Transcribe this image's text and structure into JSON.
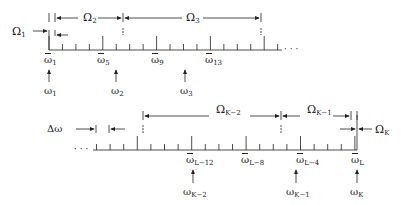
{
  "top_diagram": {
    "intervals": [
      {
        "symbol": "Ω",
        "subscript": "1",
        "x": 12,
        "y": 26
      },
      {
        "symbol": "Ω",
        "subscript": "2",
        "x": 83,
        "y": 12
      },
      {
        "symbol": "Ω",
        "subscript": "3",
        "x": 186,
        "y": 12
      }
    ],
    "grid_labels": [
      {
        "symbol": "ω̄",
        "subscript": "1",
        "x": 44,
        "y": 55
      },
      {
        "symbol": "ω̄",
        "subscript": "5",
        "x": 97,
        "y": 55
      },
      {
        "symbol": "ω̄",
        "subscript": "9",
        "x": 151,
        "y": 55
      },
      {
        "symbol": "ω̄",
        "subscript": "13",
        "x": 205,
        "y": 55
      }
    ],
    "center_labels": [
      {
        "symbol": "ω",
        "subscript": "1",
        "x": 44,
        "y": 86
      },
      {
        "symbol": "ω",
        "subscript": "2",
        "x": 111,
        "y": 86
      },
      {
        "symbol": "ω",
        "subscript": "3",
        "x": 180,
        "y": 86
      }
    ],
    "ellipsis": "· · ·"
  },
  "bottom_diagram": {
    "step_label": {
      "symbol": "Δω",
      "x": 47,
      "y": 124
    },
    "intervals": [
      {
        "symbol": "Ω",
        "subscript": "K−2",
        "x": 216,
        "y": 104
      },
      {
        "symbol": "Ω",
        "subscript": "K−1",
        "x": 307,
        "y": 104
      },
      {
        "symbol": "Ω",
        "subscript": "K",
        "x": 375,
        "y": 124
      }
    ],
    "grid_labels": [
      {
        "symbol": "ω̄",
        "subscript": "L−12",
        "x": 186,
        "y": 155
      },
      {
        "symbol": "ω̄",
        "subscript": "L−8",
        "x": 241,
        "y": 155
      },
      {
        "symbol": "ω̄",
        "subscript": "L−4",
        "x": 296,
        "y": 155
      },
      {
        "symbol": "ω̄",
        "subscript": "L",
        "x": 351,
        "y": 155
      }
    ],
    "center_labels": [
      {
        "symbol": "ω",
        "subscript": "K−2",
        "x": 183,
        "y": 187
      },
      {
        "symbol": "ω",
        "subscript": "K−1",
        "x": 286,
        "y": 187
      },
      {
        "symbol": "ω",
        "subscript": "K",
        "x": 350,
        "y": 187
      }
    ],
    "ellipsis": "· · ·"
  },
  "colors": {
    "ink": "#222222",
    "background": "#ffffff"
  }
}
